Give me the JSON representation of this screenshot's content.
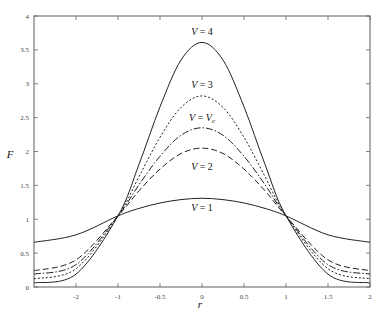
{
  "chart_data": {
    "type": "line",
    "title": "",
    "xlabel": "r",
    "ylabel": "F",
    "xlim": [
      -2,
      2
    ],
    "ylim": [
      0,
      4
    ],
    "grid": false,
    "legend": "inline labels near curve peaks",
    "x_ticks": [
      {
        "value": -1.5,
        "label": "-2"
      },
      {
        "value": -1,
        "label": "-1"
      },
      {
        "value": -0.5,
        "label": "-0.5"
      },
      {
        "value": 0,
        "label": "0"
      },
      {
        "value": 0.5,
        "label": "0.5"
      },
      {
        "value": 1,
        "label": "1"
      },
      {
        "value": 1.5,
        "label": "1.5"
      },
      {
        "value": 2,
        "label": "2"
      }
    ],
    "y_ticks": [
      {
        "value": 0,
        "label": "0"
      },
      {
        "value": 0.5,
        "label": "0.5"
      },
      {
        "value": 1,
        "label": "1"
      },
      {
        "value": 1.5,
        "label": "1.5"
      },
      {
        "value": 2,
        "label": "2"
      },
      {
        "value": 2.5,
        "label": "2.5"
      },
      {
        "value": 3,
        "label": "3"
      },
      {
        "value": 3.5,
        "label": "3.5"
      },
      {
        "value": 4,
        "label": "4"
      }
    ],
    "x": [
      -2,
      -1.5,
      -1,
      -0.75,
      -0.5,
      -0.25,
      0,
      0.25,
      0.5,
      0.75,
      1,
      1.5,
      2
    ],
    "series": [
      {
        "name": "V = 4",
        "label_main": "V",
        "label_rest": " = 4",
        "style": "solid",
        "values": [
          0.06,
          0.19,
          1.05,
          1.81,
          2.66,
          3.35,
          3.61,
          3.35,
          2.66,
          1.81,
          1.05,
          0.19,
          0.06
        ],
        "label_pos": [
          0,
          3.72
        ]
      },
      {
        "name": "V = 3",
        "label_main": "V",
        "label_rest": " = 3",
        "style": "dotted",
        "values": [
          0.12,
          0.27,
          1.05,
          1.63,
          2.21,
          2.65,
          2.82,
          2.65,
          2.21,
          1.63,
          1.05,
          0.27,
          0.12
        ],
        "label_pos": [
          0,
          2.93
        ]
      },
      {
        "name": "V = Vc",
        "label_main": "V",
        "label_rest": " = V",
        "label_sub": "c",
        "style": "dashdot",
        "values": [
          0.19,
          0.33,
          1.05,
          1.51,
          1.93,
          2.24,
          2.35,
          2.24,
          1.93,
          1.51,
          1.05,
          0.33,
          0.19
        ],
        "label_pos": [
          0,
          2.45
        ]
      },
      {
        "name": "V = 2",
        "label_main": "V",
        "label_rest": " = 2",
        "style": "dashed",
        "values": [
          0.24,
          0.4,
          1.05,
          1.42,
          1.74,
          1.97,
          2.05,
          1.97,
          1.74,
          1.42,
          1.05,
          0.4,
          0.24
        ],
        "label_pos": [
          0,
          1.72
        ]
      },
      {
        "name": "V = 1",
        "label_main": "V",
        "label_rest": " = 1",
        "style": "solid",
        "values": [
          0.66,
          0.77,
          1.05,
          1.16,
          1.24,
          1.29,
          1.31,
          1.29,
          1.24,
          1.16,
          1.05,
          0.77,
          0.66
        ],
        "label_pos": [
          0,
          1.12
        ]
      }
    ]
  }
}
